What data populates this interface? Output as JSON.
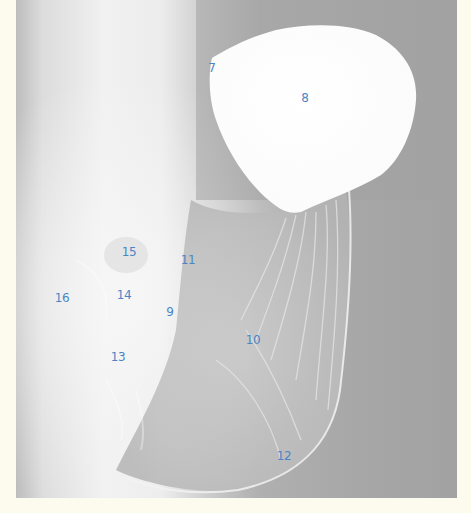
{
  "figure": {
    "type": "radiograph",
    "colors": {
      "page_background": "#fcfbee",
      "label_color": "#4a86c5"
    },
    "labels": [
      {
        "id": "7",
        "text": "7",
        "x": 212,
        "y": 68
      },
      {
        "id": "8",
        "text": "8",
        "x": 305,
        "y": 98
      },
      {
        "id": "15",
        "text": "15",
        "x": 129,
        "y": 252
      },
      {
        "id": "11",
        "text": "11",
        "x": 188,
        "y": 260
      },
      {
        "id": "16",
        "text": "16",
        "x": 62,
        "y": 298
      },
      {
        "id": "14",
        "text": "14",
        "x": 124,
        "y": 295
      },
      {
        "id": "9",
        "text": "9",
        "x": 170,
        "y": 312
      },
      {
        "id": "10",
        "text": "10",
        "x": 253,
        "y": 340
      },
      {
        "id": "13",
        "text": "13",
        "x": 118,
        "y": 357
      },
      {
        "id": "12",
        "text": "12",
        "x": 284,
        "y": 456
      }
    ]
  }
}
